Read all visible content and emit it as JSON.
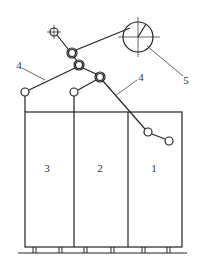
{
  "diagram": {
    "colors": {
      "line": "#222222",
      "background": "#ffffff",
      "leader": "#444444"
    },
    "labels": {
      "cabinet_1": "1",
      "cabinet_2": "2",
      "cabinet_3": "3",
      "cable_left": "4",
      "cable_right": "4",
      "drum": "5"
    },
    "cabinets": [
      {
        "id": "3",
        "x_left": 25,
        "x_right": 74
      },
      {
        "id": "2",
        "x_left": 74,
        "x_right": 128
      },
      {
        "id": "1",
        "x_left": 128,
        "x_right": 182
      }
    ],
    "cabinet_top_y": 112,
    "cabinet_bottom_y": 247,
    "ground_y": 253,
    "feet_x": [
      34,
      60,
      85,
      112,
      143,
      168
    ],
    "drum": {
      "cx": 138,
      "cy": 37,
      "r": 15
    },
    "pulleys": [
      {
        "name": "top-anchor",
        "cx": 54,
        "cy": 32,
        "r": 4
      },
      {
        "name": "upper-double",
        "cx": 72,
        "cy": 53,
        "r": 5
      },
      {
        "name": "middle-double",
        "cx": 79,
        "cy": 65,
        "r": 5
      },
      {
        "name": "right-double",
        "cx": 100,
        "cy": 77,
        "r": 5
      },
      {
        "name": "left-end",
        "cx": 25,
        "cy": 92,
        "r": 4
      },
      {
        "name": "center-end",
        "cx": 74,
        "cy": 92,
        "r": 4
      },
      {
        "name": "right-lower",
        "cx": 148,
        "cy": 132,
        "r": 4
      },
      {
        "name": "right-end",
        "cx": 169,
        "cy": 141,
        "r": 4
      }
    ]
  }
}
